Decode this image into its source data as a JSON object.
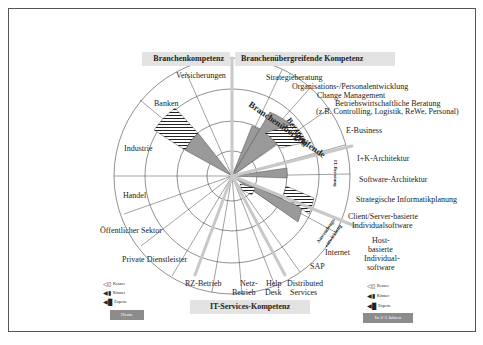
{
  "headers": {
    "branchen": "Branchenkompetenz",
    "uebergreifend": "Branchenübergreifende Kompetenz",
    "it_services": "IT-Services-Kompetenz"
  },
  "left_labels": [
    "Versicherungen",
    "Banken",
    "Industrie",
    "Handel",
    "Öffentlicher Sektor",
    "Private Dienstleister"
  ],
  "right_labels": {
    "strategie": "Strategieberatung",
    "orga": "Organisations-/Personalentwicklung",
    "change": "Change Management",
    "bwl1": "Betriebswirtschaftliche Beratung",
    "bwl2": "(z.B. Controlling, Logistik, ReWe, Personal)",
    "ebusiness": "E-Business",
    "ik": "I+K-Architektur",
    "software": "Software-Architektur",
    "strat_info": "Strategische Informatikplanung",
    "cs1": "Client/Server-basierte",
    "cs2": "Individualsoftware",
    "host1": "Host-",
    "host2": "basierte",
    "host3": "Individual-",
    "host4": "software",
    "internet": "Internet",
    "sap": "SAP"
  },
  "bottom_labels": {
    "rz": "RZ-Betrieb",
    "netz1": "Netz-",
    "netz2": "Betrieb",
    "help1": "Help",
    "help2": "Desk",
    "dist1": "Distributed",
    "dist2": "Services"
  },
  "inner_labels": {
    "branchenuebergreifende": "Branchenübergreifende",
    "beratung": "Beratung",
    "it_beratung": "IT-Beratung",
    "anwendungs": "Anwendungs-",
    "entwicklung": "entwicklung"
  },
  "legend_left": {
    "items": [
      "Kenner",
      "Könner",
      "Experte"
    ],
    "button": "Heute"
  },
  "legend_right": {
    "items": [
      "Kenner",
      "Könner",
      "Experte"
    ],
    "button": "In 2-3 Jahren"
  },
  "colors": {
    "sector_fill": "#9a9a9a",
    "divider": "#c8c8c8",
    "header_bg": "#e3e3e3",
    "button_bg": "#8c8c8c"
  }
}
